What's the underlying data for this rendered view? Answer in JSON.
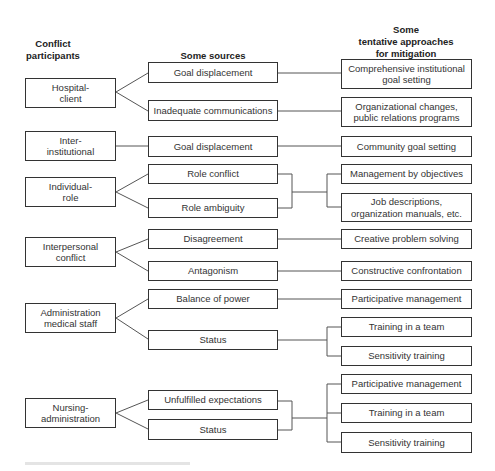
{
  "headers": {
    "participants": [
      "Conflict",
      "participants"
    ],
    "sources": [
      "Some sources"
    ],
    "mitigation": [
      "Some",
      "tentative approaches",
      "for mitigation"
    ]
  },
  "groups": [
    {
      "participant": [
        "Hospital-",
        "client"
      ],
      "sources": [
        [
          "Goal displacement"
        ],
        [
          "Inadequate communications"
        ]
      ],
      "mitigations": [
        [
          "Comprehensive institutional",
          "goal setting"
        ],
        [
          "Organizational changes,",
          "public relations programs"
        ]
      ]
    },
    {
      "participant": [
        "Inter-",
        "institutional"
      ],
      "sources": [
        [
          "Goal displacement"
        ]
      ],
      "mitigations": [
        [
          "Community goal setting"
        ]
      ]
    },
    {
      "participant": [
        "Individual-",
        "role"
      ],
      "sources": [
        [
          "Role conflict"
        ],
        [
          "Role ambiguity"
        ]
      ],
      "mitigations": [
        [
          "Management by objectives"
        ],
        [
          "Job descriptions,",
          "organization manuals, etc."
        ]
      ]
    },
    {
      "participant": [
        "Interpersonal",
        "conflict"
      ],
      "sources": [
        [
          "Disagreement"
        ],
        [
          "Antagonism"
        ]
      ],
      "mitigations": [
        [
          "Creative problem solving"
        ],
        [
          "Constructive confrontation"
        ]
      ]
    },
    {
      "participant": [
        "Administration",
        "medical staff"
      ],
      "sources": [
        [
          "Balance of power"
        ],
        [
          "Status"
        ]
      ],
      "mitigations": [
        [
          "Participative management"
        ],
        [
          "Training in a team"
        ],
        [
          "Sensitivity training"
        ]
      ]
    },
    {
      "participant": [
        "Nursing-",
        "administration"
      ],
      "sources": [
        [
          "Unfulfilled expectations"
        ],
        [
          "Status"
        ]
      ],
      "mitigations": [
        [
          "Participative management"
        ],
        [
          "Training in a team"
        ],
        [
          "Sensitivity training"
        ]
      ]
    }
  ],
  "colors": {
    "line": "#555555",
    "border": "#333333",
    "text": "#333333",
    "background": "#ffffff"
  }
}
